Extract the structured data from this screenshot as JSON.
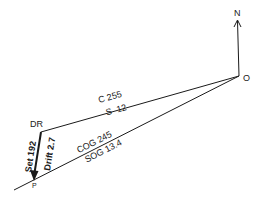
{
  "diagram": {
    "type": "navigation-current-triangle",
    "north_label": "N",
    "origin_label": "O",
    "dr_label": "DR",
    "position_label": "P",
    "course_line": {
      "course_label": "C 255",
      "speed_label": "S  12"
    },
    "ground_track_line": {
      "cog_label": "COG 245",
      "sog_label": "SOG 13.4"
    },
    "current_vector": {
      "set_label": "Set 192",
      "drift_label": "Drift 2.7"
    },
    "colors": {
      "line": "#1a1a1a",
      "background": "#ffffff"
    }
  }
}
